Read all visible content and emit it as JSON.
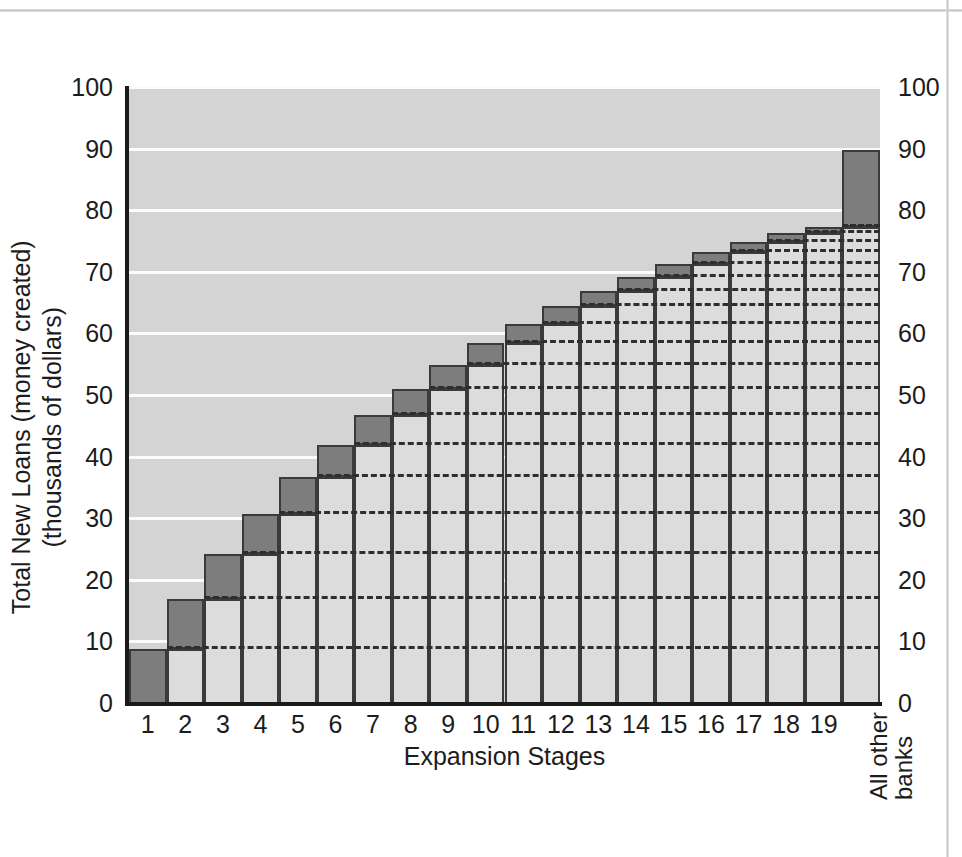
{
  "chart_data": {
    "type": "bar",
    "title": "",
    "xlabel": "Expansion Stages",
    "ylabel_lines": [
      "Total New Loans (money created)",
      "(thousands of dollars)"
    ],
    "ylim": [
      0,
      100
    ],
    "yticks": [
      0,
      10,
      20,
      30,
      40,
      50,
      60,
      70,
      80,
      90,
      100
    ],
    "ytick_labels": [
      "0",
      "10",
      "20",
      "30",
      "40",
      "50",
      "60",
      "70",
      "80",
      "90",
      "100"
    ],
    "grid": "horizontal-white-gridlines",
    "legend": "none",
    "dual_y_axis": true,
    "categories": [
      "1",
      "2",
      "3",
      "4",
      "5",
      "6",
      "7",
      "8",
      "9",
      "10",
      "11",
      "12",
      "13",
      "14",
      "15",
      "16",
      "17",
      "18",
      "19",
      "All other banks"
    ],
    "series": [
      {
        "name": "Previous cumulative total",
        "color": "#dcdcdc",
        "values": [
          0,
          9.0,
          17.1,
          24.4,
          30.9,
          36.8,
          42.1,
          46.9,
          51.2,
          55.1,
          58.6,
          61.7,
          64.6,
          67.1,
          69.4,
          71.5,
          73.3,
          75.0,
          76.5,
          77.5
        ]
      },
      {
        "name": "New loans this stage",
        "color": "#7d7d7d",
        "values": [
          9.0,
          8.1,
          7.3,
          6.5,
          5.9,
          5.3,
          4.8,
          4.3,
          3.9,
          3.5,
          3.1,
          2.9,
          2.5,
          2.3,
          2.1,
          1.8,
          1.7,
          1.5,
          1.0,
          12.5
        ]
      }
    ],
    "cumulative_totals": [
      9.0,
      17.1,
      24.4,
      30.9,
      36.8,
      42.1,
      46.9,
      51.2,
      55.1,
      58.6,
      61.7,
      64.6,
      67.1,
      69.4,
      71.5,
      73.3,
      75.0,
      76.5,
      77.5,
      90.0
    ],
    "colors": {
      "plot_background": "#d4d4d4",
      "gridline": "#fbfbfb",
      "new_loans_fill": "#7d7d7d",
      "previous_total_fill": "#dcdcdc",
      "outline": "#3a3a3a",
      "axis": "#1a1a1a",
      "dashed_level_line": "#2e2e2e",
      "text": "#1c1c1c"
    }
  },
  "axis_titles": {
    "x": "Expansion Stages",
    "y_line1": "Total New Loans (money created)",
    "y_line2": "(thousands of dollars)"
  },
  "last_category_label": {
    "line1": "All other",
    "line2": "banks"
  }
}
